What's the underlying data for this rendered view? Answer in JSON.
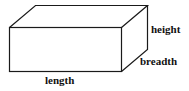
{
  "diagram": {
    "type": "cuboid",
    "labels": {
      "height": "height",
      "breadth": "breadth",
      "length": "length"
    },
    "colors": {
      "stroke": "#1a1a1a",
      "text": "#111111",
      "background": "#ffffff"
    }
  }
}
